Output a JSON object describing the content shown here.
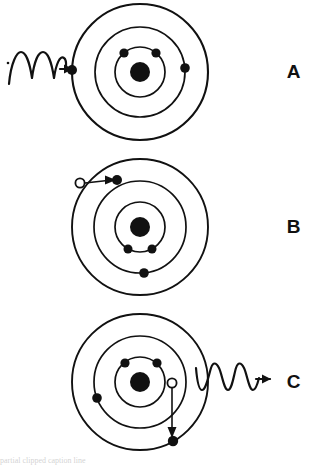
{
  "figure": {
    "background_color": "#ffffff",
    "ink_color": "#111111",
    "width": 317,
    "height": 465,
    "bottom_text_fragment": "partial clipped caption line"
  },
  "panels": [
    {
      "id": "A",
      "label": "A",
      "caption": "Incoming photon absorbed by outer-shell electron",
      "center": {
        "x": 140,
        "y": 72
      },
      "shells": [
        {
          "name": "inner-shell",
          "radius": 25
        },
        {
          "name": "middle-shell",
          "radius": 45
        },
        {
          "name": "outer-shell",
          "radius": 68
        }
      ],
      "nucleus": {
        "radius": 10
      },
      "electrons": [
        {
          "shell": 0,
          "angle_deg": 230,
          "state": "filled",
          "name": "electron-inner-left"
        },
        {
          "shell": 0,
          "angle_deg": 310,
          "state": "filled",
          "name": "electron-inner-right"
        },
        {
          "shell": 1,
          "angle_deg": 5,
          "state": "filled",
          "name": "electron-middle-right"
        },
        {
          "shell": 2,
          "angle_deg": 182,
          "state": "filled",
          "name": "electron-outer-left"
        }
      ],
      "wave": {
        "name": "incoming-photon-wave",
        "direction": "incoming",
        "cycles": 2.5,
        "amplitude": 14,
        "start_x": 8,
        "end_x": 72,
        "y": 72,
        "arrow": "right"
      },
      "transition_arrow": null
    },
    {
      "id": "B",
      "label": "B",
      "caption": "Electron excited to higher shell leaving a hole",
      "center": {
        "x": 140,
        "y": 72
      },
      "shells": [
        {
          "name": "inner-shell",
          "radius": 25
        },
        {
          "name": "middle-shell",
          "radius": 46
        },
        {
          "name": "outer-shell",
          "radius": 68
        }
      ],
      "nucleus": {
        "radius": 10
      },
      "electrons": [
        {
          "shell": 0,
          "angle_deg": 118,
          "state": "filled",
          "name": "electron-inner-left"
        },
        {
          "shell": 0,
          "angle_deg": 62,
          "state": "filled",
          "name": "electron-inner-right"
        },
        {
          "shell": 1,
          "angle_deg": 85,
          "state": "filled",
          "name": "electron-middle-bottom"
        },
        {
          "shell": 2,
          "angle_deg": 207,
          "state": "hole",
          "name": "hole-outer-upper-left"
        },
        {
          "shell": 1,
          "angle_deg": 214,
          "state": "filled",
          "name": "electron-middle-upper-left"
        }
      ],
      "wave": null,
      "transition_arrow": {
        "name": "electron-transition-arrow",
        "from": {
          "shell": 2,
          "angle_deg": 207
        },
        "to": {
          "shell": 1,
          "angle_deg": 214
        },
        "style": "straight",
        "arrow": "to-target"
      }
    },
    {
      "id": "C",
      "label": "C",
      "caption": "Electron falls back emitting a photon",
      "center": {
        "x": 140,
        "y": 72
      },
      "shells": [
        {
          "name": "inner-shell",
          "radius": 25
        },
        {
          "name": "middle-shell",
          "radius": 46
        },
        {
          "name": "outer-shell",
          "radius": 68
        }
      ],
      "nucleus": {
        "radius": 10
      },
      "electrons": [
        {
          "shell": 0,
          "angle_deg": 232,
          "state": "filled",
          "name": "electron-inner-left"
        },
        {
          "shell": 0,
          "angle_deg": 310,
          "state": "filled",
          "name": "electron-inner-right"
        },
        {
          "shell": 1,
          "angle_deg": 2,
          "state": "hole",
          "name": "hole-middle-right"
        },
        {
          "shell": 1,
          "angle_deg": 200,
          "state": "filled",
          "name": "electron-middle-left"
        },
        {
          "shell": 2,
          "angle_deg": 64,
          "state": "filled",
          "name": "electron-outer-bottom"
        }
      ],
      "wave": {
        "name": "emitted-photon-wave",
        "direction": "outgoing",
        "cycles": 3,
        "amplitude": 14,
        "start_x": 198,
        "end_x": 262,
        "y": 72,
        "arrow": "right"
      },
      "transition_arrow": {
        "name": "electron-transition-arrow",
        "from": {
          "shell": 1,
          "angle_deg": 2
        },
        "to": {
          "shell": 2,
          "angle_deg": 64
        },
        "style": "straight",
        "arrow": "to-target"
      }
    }
  ]
}
